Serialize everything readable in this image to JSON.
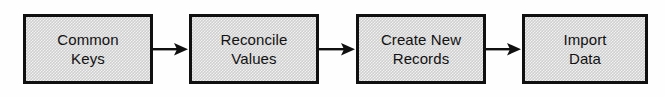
{
  "diagram": {
    "type": "linear-process-flow",
    "orientation": "left-to-right",
    "background_color": "#fefefe",
    "node_fill_color": "#cfcfcf",
    "node_border_color": "#101010",
    "arrow_color": "#101010",
    "text_color": "#111111",
    "nodes": [
      {
        "id": "common-keys",
        "label": "Common\nKeys",
        "line1": "Common",
        "line2": "Keys",
        "width": 130,
        "x": 23
      },
      {
        "id": "reconcile-values",
        "label": "Reconcile\nValues",
        "line1": "Reconcile",
        "line2": "Values",
        "width": 130,
        "x": 189
      },
      {
        "id": "create-new-records",
        "label": "Create New\nRecords",
        "line1": "Create New",
        "line2": "Records",
        "width": 130,
        "x": 356
      },
      {
        "id": "import-data",
        "label": "Import\nData",
        "line1": "Import",
        "line2": "Data",
        "width": 126,
        "x": 522
      }
    ],
    "connectors": [
      {
        "id": "arrow-1",
        "from": "common-keys",
        "to": "reconcile-values",
        "label": ""
      },
      {
        "id": "arrow-2",
        "from": "reconcile-values",
        "to": "create-new-records",
        "label": ""
      },
      {
        "id": "arrow-3",
        "from": "create-new-records",
        "to": "import-data",
        "label": ""
      }
    ]
  }
}
